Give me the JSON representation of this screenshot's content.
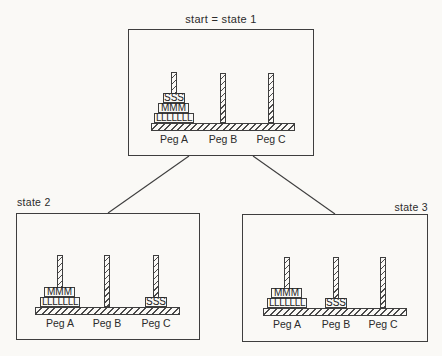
{
  "colors": {
    "paper": "#faf9f6",
    "line": "#3e3e3e",
    "text": "#2b2b2b"
  },
  "state1": {
    "title": "start = state 1",
    "disks": {
      "small": "SSS",
      "medium": "MMM",
      "large": "LLLLLLL"
    },
    "pegs": {
      "a": "Peg A",
      "b": "Peg B",
      "c": "Peg C"
    }
  },
  "state2": {
    "title": "state 2",
    "disks": {
      "medium": "MMM",
      "large": "LLLLLLL",
      "small": "SSS"
    },
    "pegs": {
      "a": "Peg A",
      "b": "Peg B",
      "c": "Peg C"
    }
  },
  "state3": {
    "title": "state 3",
    "disks": {
      "medium": "MMM",
      "large": "LLLLLLL",
      "small": "SSS"
    },
    "pegs": {
      "a": "Peg A",
      "b": "Peg B",
      "c": "Peg C"
    }
  }
}
